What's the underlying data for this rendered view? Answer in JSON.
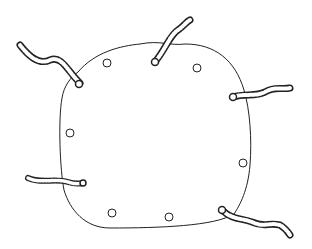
{
  "illustration": {
    "subject": "sheet with grommets and tie ropes",
    "colors": {
      "stroke": "#222222",
      "background": "#ffffff"
    },
    "grommets": [
      {
        "cx": 107,
        "cy": 63
      },
      {
        "cx": 197,
        "cy": 68
      },
      {
        "cx": 70,
        "cy": 133
      },
      {
        "cx": 243,
        "cy": 163
      },
      {
        "cx": 112,
        "cy": 213
      },
      {
        "cx": 169,
        "cy": 217
      }
    ],
    "ropes": [
      {
        "name": "top-left",
        "path": "M20,45 C30,58 40,65 50,60 C62,55 68,72 80,83"
      },
      {
        "name": "top-center",
        "path": "M155,62 C165,50 170,35 178,30 C184,26 186,22 190,20"
      },
      {
        "name": "right",
        "path": "M233,97 C245,93 255,97 265,92 C275,86 282,90 290,88"
      },
      {
        "name": "left-bottom",
        "path": "M28,178 C40,184 55,178 68,182 C74,184 78,184 83,183"
      },
      {
        "name": "bottom-right",
        "path": "M222,210 C232,220 242,218 252,222 C265,228 268,222 280,225 C285,228 288,232 290,235"
      }
    ]
  }
}
